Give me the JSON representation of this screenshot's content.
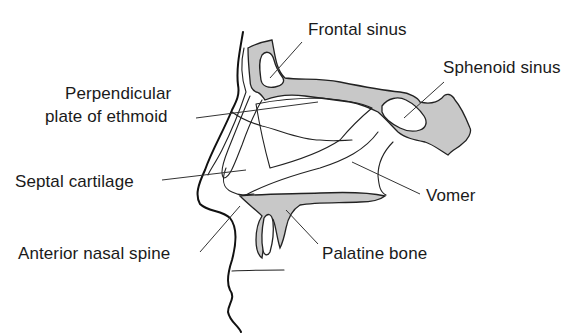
{
  "diagram": {
    "labels": {
      "frontal_sinus": "Frontal sinus",
      "sphenoid_sinus": "Sphenoid sinus",
      "perpendicular_plate_line1": "Perpendicular",
      "perpendicular_plate_line2": "plate of ethmoid",
      "septal_cartilage": "Septal cartilage",
      "vomer": "Vomer",
      "anterior_nasal_spine": "Anterior nasal spine",
      "palatine_bone": "Palatine bone"
    },
    "colors": {
      "bone_fill": "#c8c8c8",
      "outline": "#111111",
      "text": "#1a1a1a",
      "background": "#ffffff"
    }
  }
}
